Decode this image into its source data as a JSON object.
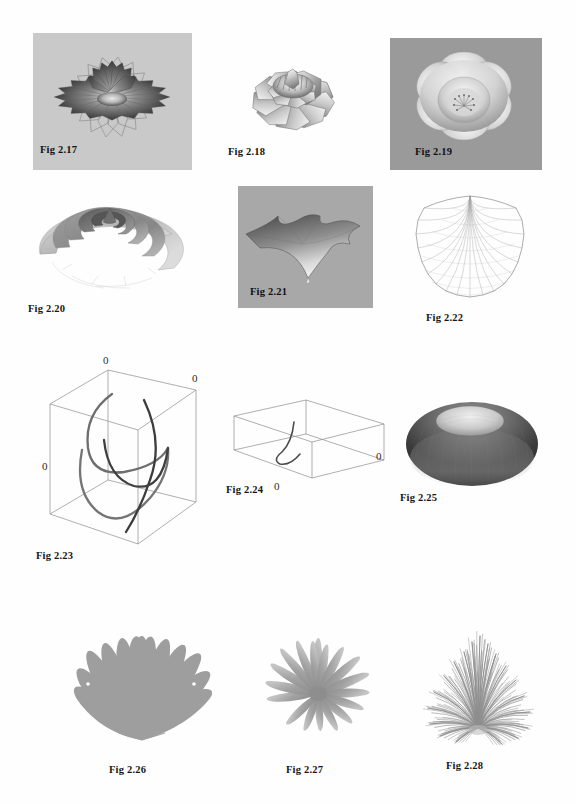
{
  "page": {
    "background": "#fefefe",
    "width": 576,
    "height": 804,
    "kind": "figure-plate",
    "rows": 4,
    "columns": 3
  },
  "figures": [
    {
      "id": "fig-2-17",
      "caption": "Fig 2.17",
      "caption_placement": "inside-panel-bottom-left",
      "panel_background": "#c9c9c9",
      "subject": "water-lily-flower-surface",
      "description": "layered star-petal lily rendered as shaded revolution surface with wireframe outer petals",
      "render": "shaded-3d-surface",
      "petal_layers": 4,
      "petals_per_layer": 16,
      "x": 33,
      "y": 33,
      "width": 159,
      "height": 137
    },
    {
      "id": "fig-2-18",
      "caption": "Fig 2.18",
      "caption_placement": "inside-panel-bottom-left",
      "panel_background": "#ffffff",
      "subject": "open-rose-flower-surface",
      "description": "broad open-petal rose with faceted wireframe petals and dense inner corolla",
      "render": "shaded-3d-surface",
      "petal_layers": 3,
      "petals_per_layer": 9,
      "x": 223,
      "y": 38,
      "width": 144,
      "height": 132
    },
    {
      "id": "fig-2-19",
      "caption": "Fig 2.19",
      "caption_placement": "inside-panel-bottom-left",
      "panel_background": "#9a9a9a",
      "subject": "cup-shaped-blossom",
      "description": "smooth cupped five-lobed blossom seen from above with stamen cluster at center",
      "render": "shaded-3d-surface",
      "petal_layers": 2,
      "petals_per_layer": 6,
      "x": 390,
      "y": 38,
      "width": 152,
      "height": 132
    },
    {
      "id": "fig-2-20",
      "caption": "Fig 2.20",
      "caption_placement": "below-panel-left",
      "panel_background": "#ffffff",
      "subject": "helicoid-spiral-ramp",
      "description": "shaded spiral ramp / shell-like helicoid surface with nested turns",
      "render": "shaded-3d-surface",
      "turns": 2,
      "x": 28,
      "y": 190,
      "width": 168,
      "height": 113
    },
    {
      "id": "fig-2-21",
      "caption": "Fig 2.21",
      "caption_placement": "inside-panel-bottom-left",
      "panel_background": "#a8a8a8",
      "subject": "astroid-star-surface",
      "description": "six-pointed cusped star surface with concave edges and a downward spike",
      "render": "shaded-3d-surface",
      "points": 6,
      "x": 238,
      "y": 186,
      "width": 135,
      "height": 122
    },
    {
      "id": "fig-2-22",
      "caption": "Fig 2.22",
      "caption_placement": "below-panel-center",
      "panel_background": "#ffffff",
      "subject": "scallop-shell-wireframe",
      "description": "fan of fine radial wires forming a scalloped shell, rays converging at the apex",
      "render": "wireframe-mesh",
      "ribs": 20,
      "x": 404,
      "y": 186,
      "width": 132,
      "height": 126
    },
    {
      "id": "fig-2-23",
      "caption": "Fig 2.23",
      "caption_placement": "below-panel-left",
      "panel_background": "#ffffff",
      "subject": "space-curve-in-bounding-box",
      "description": "tall 3D bounding box containing three looping parametric space curves",
      "render": "3d-box-with-curves",
      "axis_labels": [
        "0",
        "0",
        "0"
      ],
      "curve_count": 3,
      "x": 38,
      "y": 352,
      "width": 172,
      "height": 212
    },
    {
      "id": "fig-2-24",
      "caption": "Fig 2.24",
      "caption_placement": "below-panel-left",
      "panel_background": "#ffffff",
      "subject": "space-curve-in-flat-bounding-box",
      "description": "wide shallow 3D bounding box containing one small hook-shaped curve",
      "render": "3d-box-with-curves",
      "axis_labels": [
        "0",
        "0"
      ],
      "curve_count": 1,
      "x": 232,
      "y": 398,
      "width": 160,
      "height": 104
    },
    {
      "id": "fig-2-25",
      "caption": "Fig 2.25",
      "caption_placement": "below-panel-left",
      "panel_background": "#ffffff",
      "subject": "dark-dome-torus",
      "description": "dark shaded dome / flattened torus with bright elliptical cap on top",
      "render": "shaded-3d-surface",
      "x": 404,
      "y": 396,
      "width": 140,
      "height": 106
    },
    {
      "id": "fig-2-26",
      "caption": "Fig 2.26",
      "caption_placement": "below-panel-center",
      "panel_background": "#ffffff",
      "subject": "radiating-leaf-cluster",
      "description": "flat gray teardrop leaves fanning upward and outward from a single basal point",
      "render": "flat-silhouette",
      "leaves": 12,
      "fill": "#9e9e9e",
      "x": 68,
      "y": 612,
      "width": 148,
      "height": 152
    },
    {
      "id": "fig-2-27",
      "caption": "Fig 2.27",
      "caption_placement": "below-panel-center",
      "panel_background": "#ffffff",
      "subject": "spiky-agave-rosette",
      "description": "soft-edged gray rosette of tapering curved spikes spreading sideways",
      "render": "flat-silhouette",
      "spikes": 14,
      "fill": "#9a9a9a",
      "x": 252,
      "y": 628,
      "width": 136,
      "height": 116
    },
    {
      "id": "fig-2-28",
      "caption": "Fig 2.28",
      "caption_placement": "below-panel-center",
      "panel_background": "#ffffff",
      "subject": "grass-tuft-thin-blades",
      "description": "dense tuft of very thin gray grass blades splaying from a common base",
      "render": "line-bundle",
      "blades": 150,
      "stroke": "#8f8f8f",
      "x": 408,
      "y": 610,
      "width": 140,
      "height": 150
    }
  ]
}
